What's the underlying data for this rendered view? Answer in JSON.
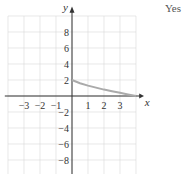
{
  "answer_label": "Yes",
  "chart_data": {
    "type": "line",
    "title": "",
    "xlabel": "x",
    "ylabel": "y",
    "xlim": [
      -4,
      4
    ],
    "ylim": [
      -10,
      10
    ],
    "x_ticks": [
      "-3",
      "-2",
      "-1",
      "1",
      "2",
      "3"
    ],
    "y_ticks": [
      "8",
      "6",
      "4",
      "2",
      "-2",
      "-4",
      "-6",
      "-8"
    ],
    "grid": true,
    "series": [
      {
        "name": "curve",
        "color": "#aaaaaa",
        "x": [
          0,
          0.5,
          1,
          1.5,
          2,
          2.5,
          3,
          3.5,
          4
        ],
        "y": [
          2,
          1.6,
          1.3,
          1.05,
          0.8,
          0.6,
          0.4,
          0.2,
          0
        ]
      }
    ]
  }
}
